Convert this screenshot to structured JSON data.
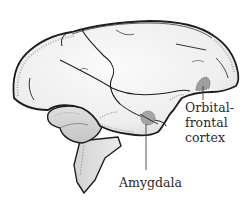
{
  "figure": {
    "colors": {
      "outline": "#1e1e1e",
      "fill": "#f0f0f0",
      "shade": "#c9c9c9",
      "highlight_region": "#9e9e9e",
      "text": "#2a2a2a",
      "background": "#ffffff"
    }
  },
  "labels": {
    "orbitofrontal": {
      "line1": "Orbital-",
      "line2": "frontal",
      "line3": "cortex"
    },
    "amygdala": {
      "text": "Amygdala"
    }
  }
}
